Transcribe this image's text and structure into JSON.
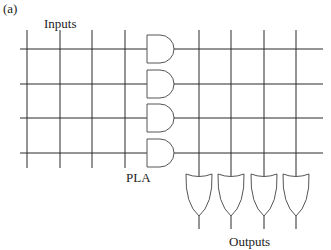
{
  "figure_label": "(a)",
  "labels": {
    "inputs": "Inputs",
    "pla": "PLA",
    "outputs": "Outputs"
  },
  "structure": {
    "input_lines": 4,
    "product_terms": 4,
    "and_gates": 4,
    "or_gates": 4,
    "outputs": 4
  },
  "colors": {
    "line": "#2a2a2a",
    "gate": "#555555",
    "background": "#ffffff"
  }
}
